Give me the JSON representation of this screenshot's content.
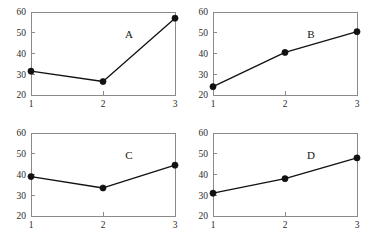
{
  "figure": {
    "background_color": "#ffffff",
    "frame_color": "#8a8a8a",
    "line_color": "#111111",
    "marker_color": "#111111",
    "layout": "2x2 grid of line plots"
  },
  "chart_data": [
    {
      "type": "line",
      "title": "A",
      "x": [
        1,
        2,
        3
      ],
      "values": [
        31.5,
        26.5,
        57
      ],
      "categories": [
        "1",
        "2",
        "3"
      ],
      "xlabel": "",
      "ylabel": "",
      "xlim": [
        1,
        3
      ],
      "ylim": [
        20,
        60
      ],
      "xticks": [
        "1",
        "2",
        "3"
      ],
      "yticks": [
        "20",
        "30",
        "40",
        "50",
        "60"
      ],
      "grid": false,
      "legend": "none",
      "marker": "filled-circle"
    },
    {
      "type": "line",
      "title": "B",
      "x": [
        1,
        2,
        3
      ],
      "values": [
        24,
        40.5,
        50.5
      ],
      "categories": [
        "1",
        "2",
        "3"
      ],
      "xlabel": "",
      "ylabel": "",
      "xlim": [
        1,
        3
      ],
      "ylim": [
        20,
        60
      ],
      "xticks": [
        "1",
        "2",
        "3"
      ],
      "yticks": [
        "20",
        "30",
        "40",
        "50",
        "60"
      ],
      "grid": false,
      "legend": "none",
      "marker": "filled-circle"
    },
    {
      "type": "line",
      "title": "C",
      "x": [
        1,
        2,
        3
      ],
      "values": [
        39,
        33.5,
        44.5
      ],
      "categories": [
        "1",
        "2",
        "3"
      ],
      "xlabel": "",
      "ylabel": "",
      "xlim": [
        1,
        3
      ],
      "ylim": [
        20,
        60
      ],
      "xticks": [
        "1",
        "2",
        "3"
      ],
      "yticks": [
        "20",
        "30",
        "40",
        "50",
        "60"
      ],
      "grid": false,
      "legend": "none",
      "marker": "filled-circle"
    },
    {
      "type": "line",
      "title": "D",
      "x": [
        1,
        2,
        3
      ],
      "values": [
        31,
        38,
        48
      ],
      "categories": [
        "1",
        "2",
        "3"
      ],
      "xlabel": "",
      "ylabel": "",
      "xlim": [
        1,
        3
      ],
      "ylim": [
        20,
        60
      ],
      "xticks": [
        "1",
        "2",
        "3"
      ],
      "yticks": [
        "20",
        "30",
        "40",
        "50",
        "60"
      ],
      "grid": false,
      "legend": "none",
      "marker": "filled-circle"
    }
  ]
}
